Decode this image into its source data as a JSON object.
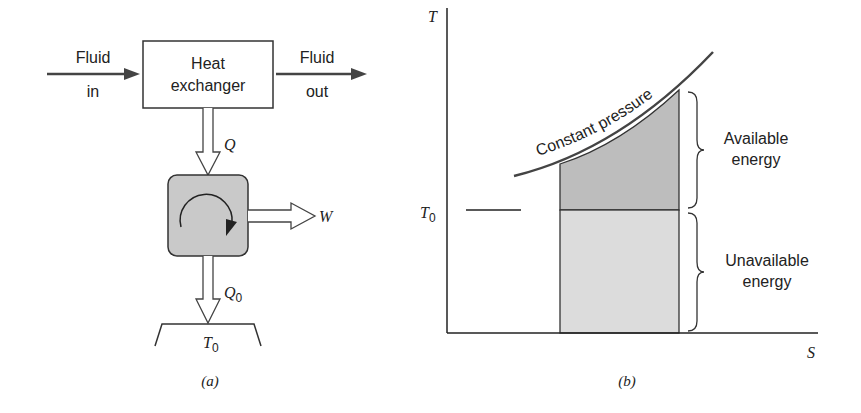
{
  "diagram_a": {
    "fluid_in_line1": "Fluid",
    "fluid_in_line2": "in",
    "heat_exchanger_line1": "Heat",
    "heat_exchanger_line2": "exchanger",
    "fluid_out_line1": "Fluid",
    "fluid_out_line2": "out",
    "heat_in_label": "Q",
    "work_label": "W",
    "heat_out_label": "Q",
    "heat_out_subscript": "0",
    "reservoir_label": "T",
    "reservoir_subscript": "0",
    "caption": "(a)"
  },
  "diagram_b": {
    "y_axis_label": "T",
    "x_axis_label": "S",
    "t0_label": "T",
    "t0_subscript": "0",
    "curve_label": "Constant pressure",
    "available_line1": "Available",
    "available_line2": "energy",
    "unavailable_line1": "Unavailable",
    "unavailable_line2": "energy",
    "caption": "(b)"
  },
  "colors": {
    "line": "#333333",
    "engine_fill": "#c9c9c9",
    "available_fill": "#bdbdbd",
    "unavailable_fill": "#dcdcdc"
  }
}
